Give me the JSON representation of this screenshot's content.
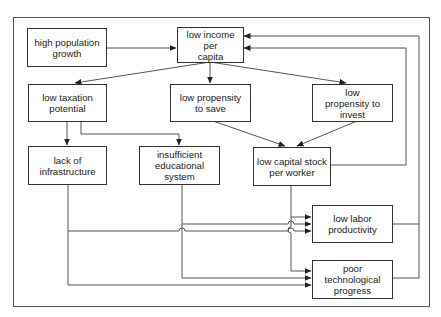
{
  "diagram": {
    "type": "flowchart",
    "title": "",
    "line_color": "#444444",
    "nodes": [
      {
        "id": "pop",
        "label": "high population\ngrowth"
      },
      {
        "id": "income",
        "label": "low income per\ncapita"
      },
      {
        "id": "tax",
        "label": "low taxation\npotential"
      },
      {
        "id": "save",
        "label": "low propensity\nto save"
      },
      {
        "id": "invest",
        "label": "low\npropensity to\ninvest"
      },
      {
        "id": "infra",
        "label": "lack of\ninfrastructure"
      },
      {
        "id": "edu",
        "label": "insufficient\neducational\nsystem"
      },
      {
        "id": "capital",
        "label": "low capital stock\nper worker"
      },
      {
        "id": "labor",
        "label": "low labor\nproductivity"
      },
      {
        "id": "tech",
        "label": "poor technological\nprogress"
      }
    ],
    "edges": [
      {
        "from": "pop",
        "to": "income"
      },
      {
        "from": "income",
        "to": "tax"
      },
      {
        "from": "income",
        "to": "save"
      },
      {
        "from": "income",
        "to": "invest"
      },
      {
        "from": "tax",
        "to": "infra"
      },
      {
        "from": "tax",
        "to": "edu"
      },
      {
        "from": "save",
        "to": "capital"
      },
      {
        "from": "invest",
        "to": "capital"
      },
      {
        "from": "capital",
        "to": "income"
      },
      {
        "from": "capital",
        "to": "labor"
      },
      {
        "from": "capital",
        "to": "tech"
      },
      {
        "from": "edu",
        "to": "labor"
      },
      {
        "from": "edu",
        "to": "tech"
      },
      {
        "from": "infra",
        "to": "labor"
      },
      {
        "from": "infra",
        "to": "tech"
      },
      {
        "from": "labor",
        "to": "income"
      },
      {
        "from": "tech",
        "to": "income"
      }
    ]
  }
}
